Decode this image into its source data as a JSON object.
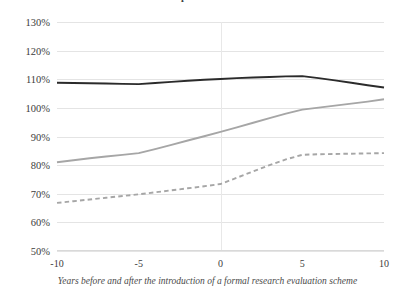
{
  "chart_data": {
    "type": "line",
    "title": "Normalised citation impact",
    "xlabel": "Years before and after the introduction of a formal research evaluation scheme",
    "ylabel": "",
    "x": [
      -10,
      -9,
      -8,
      -7,
      -6,
      -5,
      -4,
      -3,
      -2,
      -1,
      0,
      1,
      2,
      3,
      4,
      5,
      6,
      7,
      8,
      9,
      10
    ],
    "xlim": [
      -10,
      10
    ],
    "ylim": [
      50,
      130
    ],
    "grid": true,
    "legend": "none",
    "xticks": [
      "-10",
      "-5",
      "0",
      "5",
      "10"
    ],
    "xtick_values": [
      -10,
      -5,
      0,
      5,
      10
    ],
    "yticks": [
      "50%",
      "60%",
      "70%",
      "80%",
      "90%",
      "100%",
      "110%",
      "120%",
      "130%"
    ],
    "ytick_values": [
      50,
      60,
      70,
      80,
      90,
      100,
      110,
      120,
      130
    ],
    "series": [
      {
        "name": "top-group",
        "style": "solid",
        "color": "#2b2b2b",
        "values": [
          108.8,
          108.7,
          108.6,
          108.5,
          108.4,
          108.3,
          108.7,
          109.1,
          109.5,
          109.8,
          110.1,
          110.4,
          110.6,
          110.8,
          111.0,
          111.1,
          110.4,
          109.6,
          108.8,
          107.9,
          107.1
        ]
      },
      {
        "name": "middle-group",
        "style": "solid",
        "color": "#a6a6a6",
        "values": [
          81.0,
          81.7,
          82.4,
          83.0,
          83.6,
          84.2,
          85.6,
          87.1,
          88.6,
          90.1,
          91.6,
          93.2,
          94.8,
          96.4,
          98.0,
          99.4,
          100.1,
          100.8,
          101.5,
          102.2,
          103.0
        ]
      },
      {
        "name": "bottom-group",
        "style": "dashed",
        "color": "#a6a6a6",
        "values": [
          66.8,
          67.4,
          68.0,
          68.6,
          69.2,
          69.8,
          70.5,
          71.2,
          71.9,
          72.6,
          73.4,
          75.6,
          77.8,
          80.0,
          82.0,
          83.6,
          83.8,
          83.9,
          84.0,
          84.1,
          84.2
        ]
      }
    ]
  }
}
